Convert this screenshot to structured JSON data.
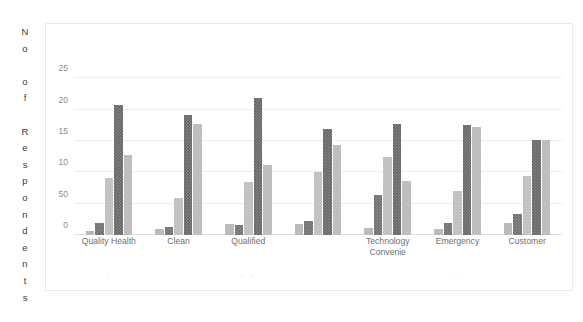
{
  "chart_data": {
    "type": "bar",
    "title": "",
    "subtitle": "",
    "xlabel": "",
    "ylabel": "No of Respondents",
    "ylabel_letters": [
      "N",
      "o",
      " ",
      "o",
      "f",
      " ",
      "R",
      "e",
      "s",
      "p",
      "o",
      "n",
      "d",
      "e",
      "n",
      "t",
      "s"
    ],
    "ytick_labels": [
      "25",
      "20",
      "15",
      "10",
      "50",
      "0"
    ],
    "ytick_values": [
      25,
      20,
      15,
      10,
      5,
      0
    ],
    "ylim": [
      0,
      26.5
    ],
    "grid": true,
    "legend": "none",
    "categories": [
      "Quality Health",
      "Clean",
      "Qualified",
      "",
      "Technology Convenie",
      "Emergency",
      "Customer"
    ],
    "category_label_lines": [
      [
        "Quality Health"
      ],
      [
        "Clean"
      ],
      [
        "Qualified"
      ],
      [
        ""
      ],
      [
        "Technology",
        "Convenie"
      ],
      [
        "Emergency"
      ],
      [
        "Customer"
      ]
    ],
    "series": [
      {
        "name": "Series 1",
        "color": "#b4b4b4",
        "values": [
          0.6,
          1.0,
          1.8,
          1.8,
          1.1,
          0.9,
          1.9
        ]
      },
      {
        "name": "Series 2",
        "color": "#6e6e6e",
        "values": [
          1.9,
          1.3,
          1.6,
          2.3,
          6.4,
          1.9,
          3.4
        ]
      },
      {
        "name": "Series 3",
        "color": "#bdbdbd",
        "values": [
          9.1,
          5.9,
          8.5,
          10.0,
          12.5,
          7.1,
          9.4
        ]
      },
      {
        "name": "Series 4",
        "color": "#656565",
        "values": [
          20.7,
          19.1,
          21.9,
          16.9,
          17.8,
          17.5,
          15.1
        ]
      },
      {
        "name": "Series 5",
        "color": "#b9b9b9",
        "values": [
          12.8,
          17.7,
          11.2,
          14.3,
          8.7,
          17.2,
          15.2
        ]
      }
    ],
    "smudge_marks": [
      "-",
      "",
      "- -",
      "",
      "",
      "- -",
      ""
    ]
  },
  "figure": {
    "background_color": "#ffffff",
    "frame_color": "#e9e9e9",
    "gridline_color": "#ededed",
    "tick_text_color": "#8a8a8a",
    "category_text_color": "#6f6f6f",
    "axis_title_color": "#3c3c3c"
  }
}
